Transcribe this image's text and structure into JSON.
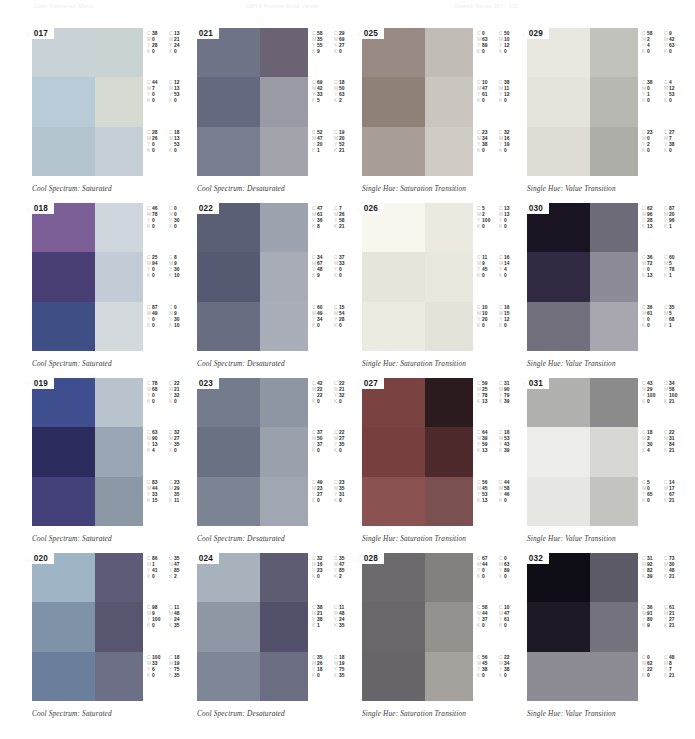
{
  "header": {
    "left": "Color Reference Sheet",
    "middle": "CMYK Process Build Values",
    "right": "Swatch Series 017 - 032"
  },
  "layout": {
    "columns": 4,
    "rows": 4,
    "col_x": [
      25,
      190,
      355,
      520
    ],
    "row_y": [
      28,
      203,
      378,
      553
    ]
  },
  "badge_prefix": "::",
  "cmyk_channels": [
    "C",
    "M",
    "Y",
    "K"
  ],
  "cards": [
    {
      "number": "017",
      "caption": "Cool Spectrum: Saturated",
      "swatch_colors": [
        "#c9d2d6",
        "#c9d3d2",
        "#b9cbd6",
        "#d5dbd2",
        "#b4c4cf",
        "#c6ced6"
      ],
      "cmyk": [
        {
          "C": 38,
          "M": 0,
          "Y": 28,
          "K": 0
        },
        {
          "C": 13,
          "M": 21,
          "Y": 24,
          "K": 0
        },
        {
          "C": 44,
          "M": 7,
          "Y": 0,
          "K": 0
        },
        {
          "C": 12,
          "M": 13,
          "Y": 53,
          "K": 0
        },
        {
          "C": 28,
          "M": 26,
          "Y": 0,
          "K": 0
        },
        {
          "C": 18,
          "M": 13,
          "Y": 53,
          "K": 0
        }
      ]
    },
    {
      "number": "018",
      "caption": "Cool Spectrum: Saturated",
      "swatch_colors": [
        "#7c5f96",
        "#cfd6dd",
        "#4a3f74",
        "#c3ccd6",
        "#3f4e85",
        "#d3d9dd"
      ],
      "cmyk": [
        {
          "C": 46,
          "M": 78,
          "Y": 0,
          "K": 0
        },
        {
          "C": 0,
          "M": 0,
          "Y": 30,
          "K": 0
        },
        {
          "C": 25,
          "M": 94,
          "Y": 0,
          "K": 0
        },
        {
          "C": 8,
          "M": 9,
          "Y": 30,
          "K": 10
        },
        {
          "C": 87,
          "M": 49,
          "Y": 0,
          "K": 0
        },
        {
          "C": 0,
          "M": 9,
          "Y": 30,
          "K": 10
        }
      ]
    },
    {
      "number": "019",
      "caption": "Cool Spectrum: Saturated",
      "swatch_colors": [
        "#3e4e8f",
        "#b9c3cd",
        "#2b2b5e",
        "#9aa6b4",
        "#44407a",
        "#8d98a6"
      ],
      "cmyk": [
        {
          "C": 78,
          "M": 68,
          "Y": 0,
          "K": 0
        },
        {
          "C": 22,
          "M": 21,
          "Y": 32,
          "K": 0
        },
        {
          "C": 63,
          "M": 90,
          "Y": 13,
          "K": 4
        },
        {
          "C": 32,
          "M": 27,
          "Y": 35,
          "K": 0
        },
        {
          "C": 83,
          "M": 44,
          "Y": 33,
          "K": 15
        },
        {
          "C": 23,
          "M": 29,
          "Y": 35,
          "K": 11
        }
      ]
    },
    {
      "number": "020",
      "caption": "Cool Spectrum: Saturated",
      "swatch_colors": [
        "#9fb4c4",
        "#5d5b78",
        "#7f92a8",
        "#575570",
        "#6b7f9c",
        "#6d6f87"
      ],
      "cmyk": [
        {
          "C": 86,
          "M": 1,
          "Y": 41,
          "K": 0
        },
        {
          "C": 35,
          "M": 47,
          "Y": 85,
          "K": 2
        },
        {
          "C": 98,
          "M": 9,
          "Y": 100,
          "K": 0
        },
        {
          "C": 11,
          "M": 48,
          "Y": 24,
          "K": 35
        },
        {
          "C": 100,
          "M": 33,
          "Y": 6,
          "K": 0
        },
        {
          "C": 18,
          "M": 19,
          "Y": 75,
          "K": 35
        }
      ]
    },
    {
      "number": "021",
      "caption": "Cool Spectrum: Desaturated",
      "swatch_colors": [
        "#6f7388",
        "#6b6374",
        "#64697f",
        "#9a9aa4",
        "#787d90",
        "#a3a3ac"
      ],
      "cmyk": [
        {
          "C": 58,
          "M": 35,
          "Y": 55,
          "K": 9
        },
        {
          "C": 29,
          "M": 69,
          "Y": 27,
          "K": 0
        },
        {
          "C": 69,
          "M": 42,
          "Y": 33,
          "K": 5
        },
        {
          "C": 18,
          "M": 50,
          "Y": 63,
          "K": 2
        },
        {
          "C": 52,
          "M": 47,
          "Y": 20,
          "K": 1
        },
        {
          "C": 19,
          "M": 20,
          "Y": 52,
          "K": 21
        }
      ]
    },
    {
      "number": "022",
      "caption": "Cool Spectrum: Desaturated",
      "swatch_colors": [
        "#5a5f76",
        "#9ca2ae",
        "#555a72",
        "#a7acb6",
        "#686d82",
        "#a9aeb8"
      ],
      "cmyk": [
        {
          "C": 47,
          "M": 61,
          "Y": 36,
          "K": 8
        },
        {
          "C": 7,
          "M": 26,
          "Y": 58,
          "K": 21
        },
        {
          "C": 34,
          "M": 67,
          "Y": 48,
          "K": 9
        },
        {
          "C": 37,
          "M": 33,
          "Y": 0,
          "K": 0
        },
        {
          "C": 60,
          "M": 49,
          "Y": 34,
          "K": 0
        },
        {
          "C": 15,
          "M": 54,
          "Y": 28,
          "K": 0
        }
      ]
    },
    {
      "number": "023",
      "caption": "Cool Spectrum: Desaturated",
      "swatch_colors": [
        "#737b8c",
        "#8f96a3",
        "#6a7183",
        "#9aa0ac",
        "#7c8392",
        "#a1a7b2"
      ],
      "cmyk": [
        {
          "C": 42,
          "M": 22,
          "Y": 22,
          "K": 0
        },
        {
          "C": 22,
          "M": 21,
          "Y": 32,
          "K": 0
        },
        {
          "C": 37,
          "M": 50,
          "Y": 37,
          "K": 0
        },
        {
          "C": 22,
          "M": 27,
          "Y": 35,
          "K": 0
        },
        {
          "C": 49,
          "M": 23,
          "Y": 27,
          "K": 0
        },
        {
          "C": 23,
          "M": 35,
          "Y": 31,
          "K": 0
        }
      ]
    },
    {
      "number": "024",
      "caption": "Cool Spectrum: Desaturated",
      "swatch_colors": [
        "#a8b2bd",
        "#5e5c72",
        "#8f97a4",
        "#52506a",
        "#7f8796",
        "#6b6d82"
      ],
      "cmyk": [
        {
          "C": 32,
          "M": 16,
          "Y": 23,
          "K": 0
        },
        {
          "C": 35,
          "M": 47,
          "Y": 85,
          "K": 2
        },
        {
          "C": 38,
          "M": 21,
          "Y": 38,
          "K": 1
        },
        {
          "C": 11,
          "M": 48,
          "Y": 24,
          "K": 35
        },
        {
          "C": 35,
          "M": 26,
          "Y": 18,
          "K": 0
        },
        {
          "C": 18,
          "M": 19,
          "Y": 75,
          "K": 35
        }
      ]
    },
    {
      "number": "025",
      "caption": "Single Hue: Saturation Transition",
      "swatch_colors": [
        "#9a8a84",
        "#c2bcb6",
        "#8f8078",
        "#cac5bf",
        "#a99e96",
        "#cfcac4"
      ],
      "cmyk": [
        {
          "C": 0,
          "M": 63,
          "Y": 89,
          "K": 0
        },
        {
          "C": 50,
          "M": 10,
          "Y": 12,
          "K": 0
        },
        {
          "C": 10,
          "M": 47,
          "Y": 61,
          "K": 0
        },
        {
          "C": 38,
          "M": 11,
          "Y": 12,
          "K": 0
        },
        {
          "C": 23,
          "M": 34,
          "Y": 38,
          "K": 0
        },
        {
          "C": 32,
          "M": 16,
          "Y": 19,
          "K": 0
        }
      ]
    },
    {
      "number": "026",
      "caption": "Single Hue: Saturation Transition",
      "swatch_colors": [
        "#f7f6ef",
        "#eceae0",
        "#e6e5db",
        "#e9e8de",
        "#ecebe2",
        "#e4e3d9"
      ],
      "cmyk": [
        {
          "C": 5,
          "M": 2,
          "Y": 100,
          "K": 0
        },
        {
          "C": 13,
          "M": 13,
          "Y": 0,
          "K": 0
        },
        {
          "C": 11,
          "M": 9,
          "Y": 45,
          "K": 0
        },
        {
          "C": 16,
          "M": 14,
          "Y": 4,
          "K": 0
        },
        {
          "C": 10,
          "M": 10,
          "Y": 20,
          "K": 0
        },
        {
          "C": 16,
          "M": 15,
          "Y": 12,
          "K": 0
        }
      ]
    },
    {
      "number": "027",
      "caption": "Single Hue: Saturation Transition",
      "swatch_colors": [
        "#7a4240",
        "#2b1a1e",
        "#77403e",
        "#4e2a2c",
        "#8a5250",
        "#7a5150"
      ],
      "cmyk": [
        {
          "C": 59,
          "M": 25,
          "Y": 78,
          "K": 13
        },
        {
          "C": 31,
          "M": 90,
          "Y": 79,
          "K": 39
        },
        {
          "C": 64,
          "M": 39,
          "Y": 59,
          "K": 13
        },
        {
          "C": 18,
          "M": 53,
          "Y": 43,
          "K": 39
        },
        {
          "C": 56,
          "M": 45,
          "Y": 53,
          "K": 13
        },
        {
          "C": 44,
          "M": 58,
          "Y": 46,
          "K": 0
        }
      ]
    },
    {
      "number": "028",
      "caption": "Single Hue: Saturation Transition",
      "swatch_colors": [
        "#6d6a6e",
        "#83807f",
        "#6a676b",
        "#94918e",
        "#67646a",
        "#a5a29e"
      ],
      "cmyk": [
        {
          "C": 67,
          "M": 44,
          "Y": 0,
          "K": 0
        },
        {
          "C": 0,
          "M": 63,
          "Y": 89,
          "K": 0
        },
        {
          "C": 58,
          "M": 44,
          "Y": 37,
          "K": 0
        },
        {
          "C": 10,
          "M": 47,
          "Y": 61,
          "K": 0
        },
        {
          "C": 56,
          "M": 45,
          "Y": 38,
          "K": 0
        },
        {
          "C": 22,
          "M": 34,
          "Y": 38,
          "K": 0
        }
      ]
    },
    {
      "number": "029",
      "caption": "Single Hue: Value Transition",
      "swatch_colors": [
        "#e8e7e0",
        "#c2c2bc",
        "#e4e3dc",
        "#b8b8b2",
        "#dedcd5",
        "#aeaea8"
      ],
      "cmyk": [
        {
          "C": 58,
          "M": 2,
          "Y": 4,
          "K": 0
        },
        {
          "C": 9,
          "M": 42,
          "Y": 63,
          "K": 0
        },
        {
          "C": 38,
          "M": 0,
          "Y": 1,
          "K": 0
        },
        {
          "C": 4,
          "M": 12,
          "Y": 53,
          "K": 0
        },
        {
          "C": 23,
          "M": 0,
          "Y": 2,
          "K": 0
        },
        {
          "C": 27,
          "M": 7,
          "Y": 38,
          "K": 0
        }
      ]
    },
    {
      "number": "030",
      "caption": "Single Hue: Value Transition",
      "swatch_colors": [
        "#1a1422",
        "#6d6b78",
        "#322a42",
        "#8d8b96",
        "#71707c",
        "#a8a6ae"
      ],
      "cmyk": [
        {
          "C": 62,
          "M": 96,
          "Y": 28,
          "K": 13
        },
        {
          "C": 87,
          "M": 20,
          "Y": 96,
          "K": 1
        },
        {
          "C": 36,
          "M": 72,
          "Y": 0,
          "K": 13
        },
        {
          "C": 60,
          "M": 5,
          "Y": 78,
          "K": 1
        },
        {
          "C": 36,
          "M": 61,
          "Y": 0,
          "K": 0
        },
        {
          "C": 35,
          "M": 5,
          "Y": 68,
          "K": 1
        }
      ]
    },
    {
      "number": "031",
      "caption": "Single Hue: Value Transition",
      "swatch_colors": [
        "#b0b0ae",
        "#8b8b8c",
        "#ededea",
        "#d7d7d4",
        "#e6e6e3",
        "#c3c3c0"
      ],
      "cmyk": [
        {
          "C": 43,
          "M": 29,
          "Y": 100,
          "K": 0
        },
        {
          "C": 34,
          "M": 58,
          "Y": 100,
          "K": 21
        },
        {
          "C": 18,
          "M": 2,
          "Y": 30,
          "K": 4
        },
        {
          "C": 22,
          "M": 31,
          "Y": 84,
          "K": 21
        },
        {
          "C": 5,
          "M": 0,
          "Y": 65,
          "K": 0
        },
        {
          "C": 14,
          "M": 17,
          "Y": 67,
          "K": 21
        }
      ]
    },
    {
      "number": "032",
      "caption": "Single Hue: Value Transition",
      "swatch_colors": [
        "#0f0d16",
        "#5c5a64",
        "#1d1a26",
        "#74727c",
        "#8d8b94",
        "#8d8b94"
      ],
      "cmyk": [
        {
          "C": 31,
          "M": 92,
          "Y": 82,
          "K": 39
        },
        {
          "C": 73,
          "M": 30,
          "Y": 48,
          "K": 21
        },
        {
          "C": 36,
          "M": 91,
          "Y": 80,
          "K": 9
        },
        {
          "C": 61,
          "M": 21,
          "Y": 27,
          "K": 21
        },
        {
          "C": 0,
          "M": 62,
          "Y": 22,
          "K": 0
        },
        {
          "C": 48,
          "M": 8,
          "Y": 7,
          "K": 21
        }
      ]
    }
  ]
}
